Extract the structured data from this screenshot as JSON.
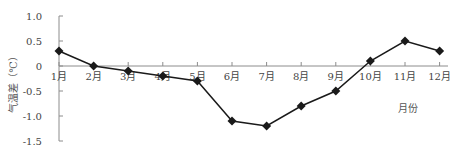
{
  "chart_data": {
    "type": "line",
    "title": "",
    "xlabel": "月份",
    "ylabel": "气温差（℃）",
    "categories": [
      "1月",
      "2月",
      "3月",
      "4月",
      "5月",
      "6月",
      "7月",
      "8月",
      "9月",
      "10月",
      "11月",
      "12月"
    ],
    "series": [
      {
        "name": "气温差",
        "values": [
          0.3,
          0.0,
          -0.1,
          -0.2,
          -0.3,
          -1.1,
          -1.2,
          -0.8,
          -0.5,
          0.1,
          0.5,
          0.3
        ]
      }
    ],
    "ylim": [
      -1.5,
      1.0
    ],
    "yticks": [
      "1.0",
      "0.5",
      "0",
      "-0.5",
      "-1.0",
      "-1.5"
    ],
    "ytick_values": [
      1.0,
      0.5,
      0,
      -0.5,
      -1.0,
      -1.5
    ],
    "grid": false,
    "legend": "none",
    "marker": "diamond",
    "colors": {
      "line": "#1a1a1a",
      "axis": "#8c8c8c",
      "text": "#444444"
    }
  }
}
